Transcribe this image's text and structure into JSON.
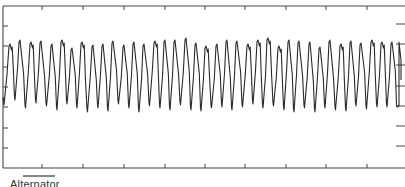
{
  "chart_data": {
    "type": "line",
    "title": "",
    "xlabel": "",
    "ylabel": "",
    "grid": false,
    "legend": null,
    "annotation": {
      "scale_bar_label": "Alternator",
      "scale_bar_px": [
        23,
        55
      ]
    },
    "frame": {
      "left": 3,
      "top": 6,
      "bottom": 168,
      "right": 405
    },
    "x_ticks_px": [
      42,
      83,
      124,
      165,
      205,
      245,
      286,
      326,
      367
    ],
    "y_ticks_left_px": [
      26,
      46,
      67,
      87,
      107,
      128,
      148
    ],
    "y_ticks_right_px": [
      24,
      44,
      65,
      86,
      106,
      126,
      146
    ],
    "cycles": 38,
    "period_px": 10.3,
    "peak_y_range_px": [
      36,
      50
    ],
    "trough_y_range_px": [
      98,
      114
    ],
    "peaks_x_px": [
      10,
      20,
      31,
      41,
      52,
      62,
      72,
      82,
      93,
      103,
      113,
      124,
      134,
      144,
      155,
      165,
      175,
      186,
      196,
      206,
      217,
      227,
      237,
      248,
      258,
      268,
      279,
      289,
      299,
      310,
      320,
      330,
      341,
      351,
      361,
      372,
      382,
      392
    ],
    "peaks_y_px": [
      44,
      40,
      42,
      41,
      44,
      40,
      48,
      42,
      45,
      44,
      41,
      45,
      42,
      44,
      41,
      40,
      40,
      38,
      43,
      46,
      44,
      40,
      41,
      44,
      40,
      38,
      46,
      40,
      41,
      42,
      47,
      40,
      44,
      41,
      43,
      40,
      42,
      42
    ],
    "troughs_y_px": [
      105,
      100,
      108,
      103,
      106,
      110,
      104,
      108,
      112,
      108,
      111,
      104,
      108,
      112,
      106,
      108,
      110,
      105,
      110,
      111,
      108,
      107,
      110,
      107,
      104,
      108,
      106,
      110,
      112,
      108,
      112,
      108,
      110,
      111,
      106,
      109,
      107,
      107
    ]
  },
  "labels": {
    "scale_bar": "Alternator"
  }
}
